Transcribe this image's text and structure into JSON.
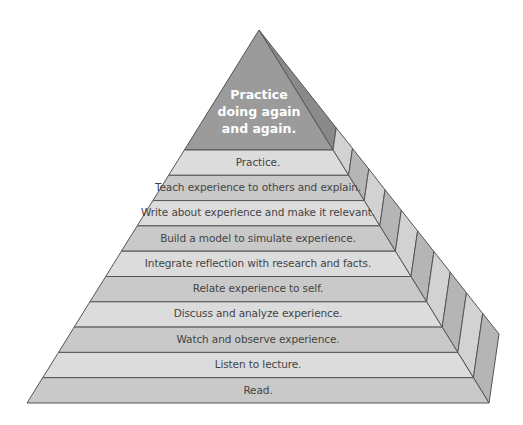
{
  "diagram": {
    "type": "pyramid",
    "title": "",
    "apex": {
      "lines": [
        "Practice",
        "doing again",
        "and again."
      ],
      "color": "#9b9b9b"
    },
    "levels": [
      {
        "label": "Practice.",
        "color": "#dcdcdc"
      },
      {
        "label": "Teach experience to others and explain.",
        "color": "#c9c9c9"
      },
      {
        "label": "Write about experience and make it relevant.",
        "color": "#dcdcdc"
      },
      {
        "label": "Build a model to simulate experience.",
        "color": "#c9c9c9"
      },
      {
        "label": "Integrate reflection with research and facts.",
        "color": "#dcdcdc"
      },
      {
        "label": "Relate experience to self.",
        "color": "#c9c9c9"
      },
      {
        "label": "Discuss and analyze experience.",
        "color": "#dcdcdc"
      },
      {
        "label": "Watch and observe experience.",
        "color": "#c9c9c9"
      },
      {
        "label": "Listen to lecture.",
        "color": "#dcdcdc"
      },
      {
        "label": "Read.",
        "color": "#c9c9c9"
      }
    ],
    "colors": {
      "outline": "#555555",
      "side_dark": "#b5b5b5",
      "side_light": "#d2d2d2",
      "apex_side": "#8a8a8a"
    }
  }
}
